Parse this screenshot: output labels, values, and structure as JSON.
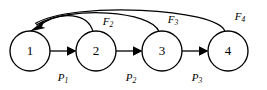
{
  "figure": {
    "type": "directed-graph-diagram",
    "background_color": "#ffffff",
    "stroke_color": "#000000"
  },
  "nodes": [
    {
      "id": "node-1",
      "label": "1",
      "cx": 30,
      "cy": 51,
      "r": 20
    },
    {
      "id": "node-2",
      "label": "2",
      "cx": 96,
      "cy": 51,
      "r": 20
    },
    {
      "id": "node-3",
      "label": "3",
      "cx": 162,
      "cy": 51,
      "r": 20
    },
    {
      "id": "node-4",
      "label": "4",
      "cx": 228,
      "cy": 51,
      "r": 20
    }
  ],
  "forward_edges": [
    {
      "id": "edge-p1",
      "from": "node-1",
      "to": "node-2",
      "label_base": "P",
      "label_sub": "1",
      "label_x": 63,
      "label_y": 78
    },
    {
      "id": "edge-p2",
      "from": "node-2",
      "to": "node-3",
      "label_base": "P",
      "label_sub": "2",
      "label_x": 131,
      "label_y": 78
    },
    {
      "id": "edge-p3",
      "from": "node-3",
      "to": "node-4",
      "label_base": "P",
      "label_sub": "3",
      "label_x": 197,
      "label_y": 78
    }
  ],
  "feedback_edges": [
    {
      "id": "arc-f2",
      "from": "node-2",
      "to": "node-1",
      "label_base": "F",
      "label_sub": "2",
      "label_x": 108,
      "label_y": 22
    },
    {
      "id": "arc-f3",
      "from": "node-3",
      "to": "node-1",
      "label_base": "F",
      "label_sub": "3",
      "label_x": 173,
      "label_y": 20
    },
    {
      "id": "arc-f4",
      "from": "node-4",
      "to": "node-1",
      "label_base": "F",
      "label_sub": "4",
      "label_x": 240,
      "label_y": 17
    }
  ]
}
